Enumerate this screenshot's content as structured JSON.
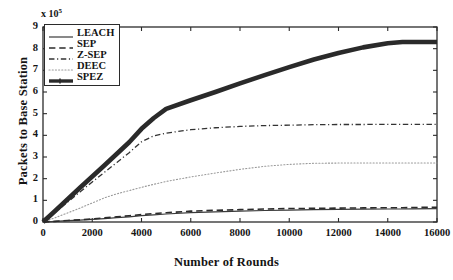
{
  "chart_data": {
    "type": "line",
    "title": "",
    "xlabel": "Number of Rounds",
    "ylabel": "Packets to Base Station",
    "y_multiplier": "x 10",
    "y_multiplier_exp": "5",
    "xlim": [
      0,
      16000
    ],
    "ylim": [
      0,
      9
    ],
    "xticks": [
      0,
      2000,
      4000,
      6000,
      8000,
      10000,
      12000,
      14000,
      16000
    ],
    "yticks": [
      0,
      1,
      2,
      3,
      4,
      5,
      6,
      7,
      8,
      9
    ],
    "grid": false,
    "legend_position": "upper-left",
    "x": [
      0,
      500,
      1000,
      1500,
      2000,
      2500,
      3000,
      3500,
      4000,
      4500,
      5000,
      6000,
      7000,
      8000,
      9000,
      10000,
      11000,
      12000,
      13000,
      14000,
      14600,
      15000,
      16000
    ],
    "series": [
      {
        "name": "LEACH",
        "style": "solid",
        "width": 1.2,
        "color": "#3a3a3a",
        "values": [
          0,
          0.03,
          0.06,
          0.09,
          0.12,
          0.16,
          0.2,
          0.24,
          0.29,
          0.33,
          0.37,
          0.43,
          0.47,
          0.5,
          0.53,
          0.55,
          0.57,
          0.58,
          0.59,
          0.6,
          0.6,
          0.61,
          0.62
        ]
      },
      {
        "name": "SEP",
        "style": "dashed",
        "width": 1.6,
        "color": "#2b2b2b",
        "values": [
          0,
          0.03,
          0.07,
          0.1,
          0.14,
          0.19,
          0.24,
          0.29,
          0.34,
          0.39,
          0.43,
          0.5,
          0.54,
          0.57,
          0.6,
          0.62,
          0.63,
          0.64,
          0.65,
          0.66,
          0.66,
          0.67,
          0.68
        ]
      },
      {
        "name": "Z-SEP",
        "style": "dashdot",
        "width": 1.3,
        "color": "#333333",
        "values": [
          0,
          0.45,
          0.92,
          1.38,
          1.85,
          2.3,
          2.75,
          3.2,
          3.7,
          3.98,
          4.1,
          4.26,
          4.35,
          4.41,
          4.45,
          4.47,
          4.49,
          4.5,
          4.5,
          4.51,
          4.51,
          4.51,
          4.51
        ]
      },
      {
        "name": "DEEC",
        "style": "dotted",
        "width": 1.1,
        "color": "#9a9a9a",
        "values": [
          0,
          0.2,
          0.42,
          0.64,
          0.88,
          1.12,
          1.3,
          1.45,
          1.6,
          1.74,
          1.87,
          2.08,
          2.26,
          2.43,
          2.57,
          2.66,
          2.71,
          2.72,
          2.72,
          2.72,
          2.72,
          2.72,
          2.72
        ]
      },
      {
        "name": "SPEZ",
        "style": "solid",
        "width": 4.6,
        "color": "#2a2a2a",
        "values": [
          0,
          0.52,
          1.05,
          1.58,
          2.1,
          2.62,
          3.15,
          3.68,
          4.3,
          4.8,
          5.22,
          5.62,
          6.0,
          6.4,
          6.78,
          7.15,
          7.5,
          7.8,
          8.06,
          8.25,
          8.31,
          8.31,
          8.31
        ]
      }
    ]
  }
}
